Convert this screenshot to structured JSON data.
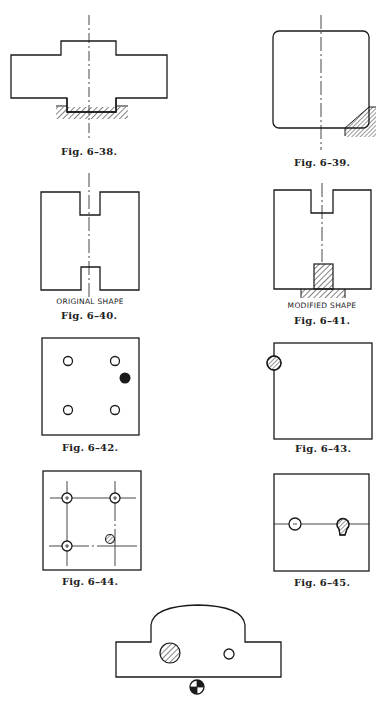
{
  "page": {
    "background": "#ffffff",
    "ink": "#1a1a1a"
  },
  "figures": [
    {
      "id": "6-38",
      "caption": "Fig. 6–38.",
      "description": "Cross-shaped part resting on hatched support, with vertical centerline"
    },
    {
      "id": "6-39",
      "caption": "Fig. 6–39.",
      "description": "Rounded-corner square part with hatched corner support at lower right"
    },
    {
      "id": "6-40",
      "caption": "Fig. 6–40.",
      "label": "ORIGINAL SHAPE",
      "description": "H-shaped block with top and bottom notches"
    },
    {
      "id": "6-41",
      "caption": "Fig. 6–41.",
      "label": "MODIFIED SHAPE",
      "description": "Block with top notch and hatched locating block in bottom notch"
    },
    {
      "id": "6-42",
      "caption": "Fig. 6–42.",
      "description": "Square plate with four open holes and one filled locator"
    },
    {
      "id": "6-43",
      "caption": "Fig. 6–43.",
      "description": "Square plate with hatched locating pin at upper left edge"
    },
    {
      "id": "6-44",
      "caption": "Fig. 6–44.",
      "description": "Square plate with hole pattern on center lines and hatched pin"
    },
    {
      "id": "6-45",
      "caption": "Fig. 6–45.",
      "description": "Square plate with open hole and keyhole-shaped hatched pin on horizontal center line"
    },
    {
      "id": "6-46",
      "caption": "",
      "description": "Domed part with hatched pin, small hole, and center-of-gravity symbol below"
    }
  ]
}
